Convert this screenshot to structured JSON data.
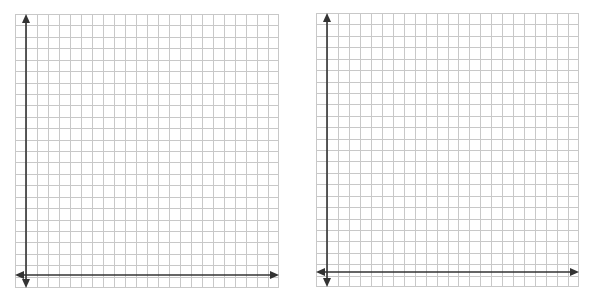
{
  "graphs": [
    {
      "id": "left",
      "x": 15,
      "y": 14,
      "width": 264,
      "height": 274,
      "cols": 24,
      "rows": 24,
      "y_axis_x": 11,
      "x_axis_y": 261
    },
    {
      "id": "right",
      "x": 316,
      "y": 13,
      "width": 263,
      "height": 274,
      "cols": 24,
      "rows": 24,
      "y_axis_x": 11,
      "x_axis_y": 259
    }
  ],
  "colors": {
    "grid_line": "#c8c8c8",
    "axis": "#333333",
    "background": "#ffffff"
  }
}
